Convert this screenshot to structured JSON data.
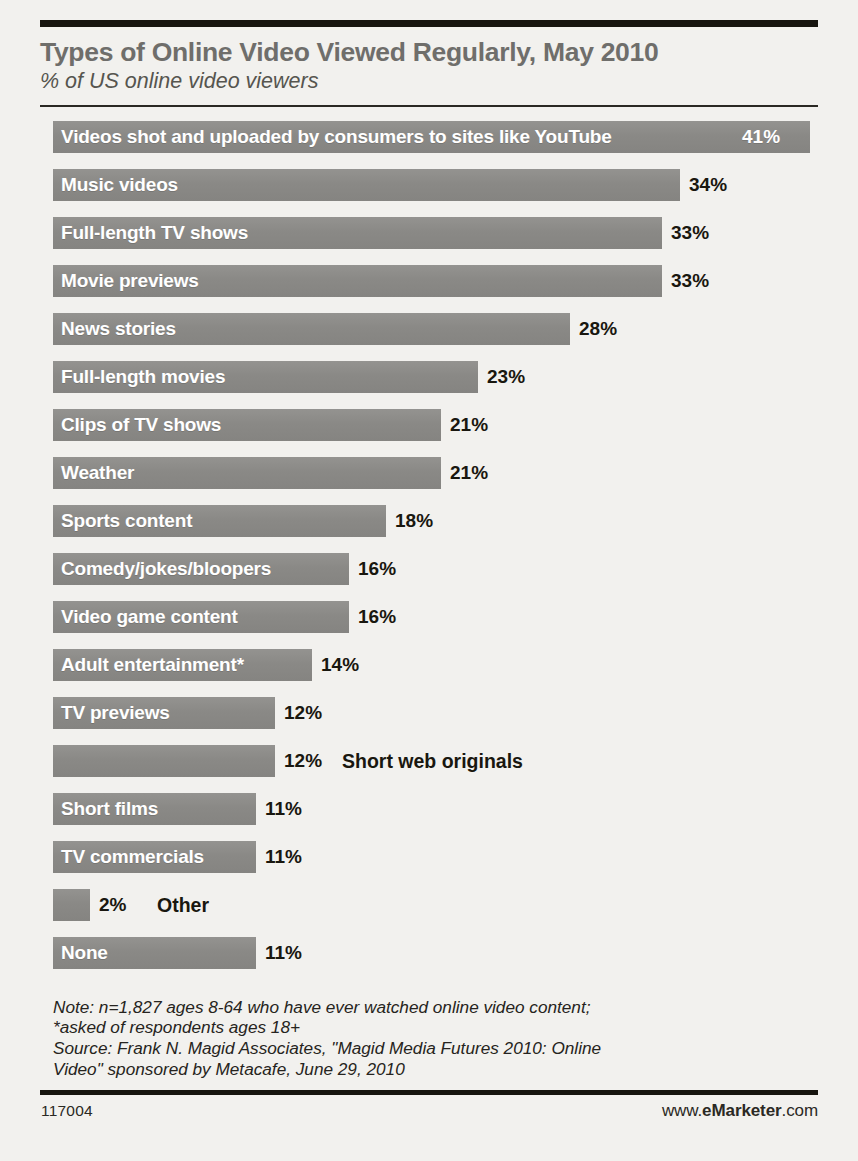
{
  "header": {
    "title": "Types of Online Video Viewed Regularly, May 2010",
    "subtitle": "% of US online video viewers"
  },
  "chart_data": {
    "type": "bar",
    "title": "Types of Online Video Viewed Regularly, May 2010",
    "subtitle": "% of US online video viewers",
    "orientation": "horizontal",
    "xlabel": "",
    "ylabel": "",
    "xlim": [
      0,
      41
    ],
    "grid": false,
    "legend": null,
    "value_suffix": "%",
    "categories": [
      "Videos shot and uploaded by consumers to sites like YouTube",
      "Music videos",
      "Full-length TV shows",
      "Movie previews",
      "News stories",
      "Full-length movies",
      "Clips of TV shows",
      "Weather",
      "Sports content",
      "Comedy/jokes/bloopers",
      "Video game content",
      "Adult entertainment*",
      "TV previews",
      "Short web originals",
      "Short films",
      "TV commercials",
      "Other",
      "None"
    ],
    "values": [
      41,
      34,
      33,
      33,
      28,
      23,
      21,
      21,
      18,
      16,
      16,
      14,
      12,
      12,
      11,
      11,
      2,
      11
    ],
    "bars": [
      {
        "label": "Videos shot and uploaded by consumers to sites like YouTube",
        "value": 41,
        "value_text": "41%",
        "label_placement": "inside",
        "value_placement": "inside",
        "bar_px": 757
      },
      {
        "label": "Music videos",
        "value": 34,
        "value_text": "34%",
        "label_placement": "inside",
        "value_placement": "outside",
        "bar_px": 627
      },
      {
        "label": "Full-length TV shows",
        "value": 33,
        "value_text": "33%",
        "label_placement": "inside",
        "value_placement": "outside",
        "bar_px": 609
      },
      {
        "label": "Movie previews",
        "value": 33,
        "value_text": "33%",
        "label_placement": "inside",
        "value_placement": "outside",
        "bar_px": 609
      },
      {
        "label": "News stories",
        "value": 28,
        "value_text": "28%",
        "label_placement": "inside",
        "value_placement": "outside",
        "bar_px": 517
      },
      {
        "label": "Full-length movies",
        "value": 23,
        "value_text": "23%",
        "label_placement": "inside",
        "value_placement": "outside",
        "bar_px": 425
      },
      {
        "label": "Clips of TV shows",
        "value": 21,
        "value_text": "21%",
        "label_placement": "inside",
        "value_placement": "outside",
        "bar_px": 388
      },
      {
        "label": "Weather",
        "value": 21,
        "value_text": "21%",
        "label_placement": "inside",
        "value_placement": "outside",
        "bar_px": 388
      },
      {
        "label": "Sports content",
        "value": 18,
        "value_text": "18%",
        "label_placement": "inside",
        "value_placement": "outside",
        "bar_px": 333
      },
      {
        "label": "Comedy/jokes/bloopers",
        "value": 16,
        "value_text": "16%",
        "label_placement": "inside",
        "value_placement": "outside",
        "bar_px": 296
      },
      {
        "label": "Video game content",
        "value": 16,
        "value_text": "16%",
        "label_placement": "inside",
        "value_placement": "outside",
        "bar_px": 296
      },
      {
        "label": "Adult entertainment*",
        "value": 14,
        "value_text": "14%",
        "label_placement": "inside",
        "value_placement": "outside",
        "bar_px": 259
      },
      {
        "label": "TV previews",
        "value": 12,
        "value_text": "12%",
        "label_placement": "inside",
        "value_placement": "outside",
        "bar_px": 222
      },
      {
        "label": "Short web originals",
        "value": 12,
        "value_text": "12%",
        "label_placement": "outside",
        "value_placement": "outside",
        "bar_px": 222
      },
      {
        "label": "Short films",
        "value": 11,
        "value_text": "11%",
        "label_placement": "inside",
        "value_placement": "outside",
        "bar_px": 203
      },
      {
        "label": "TV commercials",
        "value": 11,
        "value_text": "11%",
        "label_placement": "inside",
        "value_placement": "outside",
        "bar_px": 203
      },
      {
        "label": "Other",
        "value": 2,
        "value_text": "2%",
        "label_placement": "outside",
        "value_placement": "outside",
        "bar_px": 37
      },
      {
        "label": "None",
        "value": 11,
        "value_text": "11%",
        "label_placement": "inside",
        "value_placement": "outside",
        "bar_px": 203
      }
    ]
  },
  "footer": {
    "note_line_1": "Note: n=1,827 ages 8-64 who have ever watched online video content;",
    "note_line_2": "*asked of respondents ages 18+",
    "source_line_1": "Source: Frank N. Magid Associates, \"Magid Media Futures 2010: Online",
    "source_line_2": "Video\" sponsored by Metacafe, June 29, 2010",
    "doc_id": "117004",
    "brand_prefix": "www.",
    "brand_name": "eMarketer",
    "brand_suffix": ".com"
  },
  "colors": {
    "bar": "#8b8a87",
    "title": "#6f6e6b",
    "rule": "#17150f",
    "page_bg": "#f2f1ee",
    "value_text": "#19170f"
  }
}
